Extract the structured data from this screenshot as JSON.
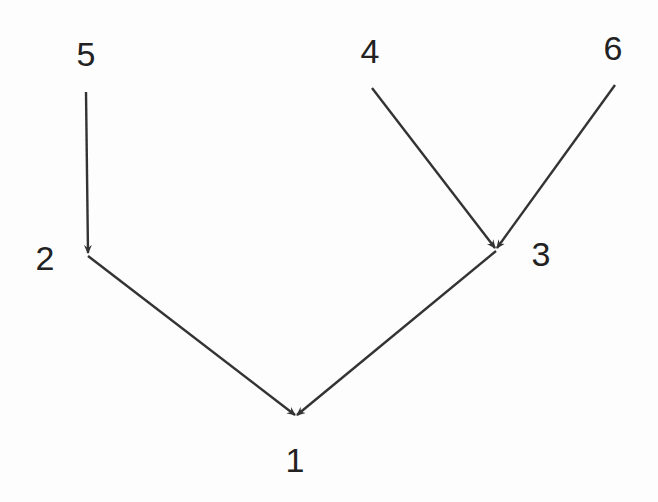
{
  "diagram": {
    "type": "directed-tree",
    "stroke_color": "#333333",
    "label_color": "#222222",
    "background": "#fdfdfd",
    "nodes": [
      {
        "id": "1",
        "label": "1",
        "x": 295,
        "y": 460
      },
      {
        "id": "2",
        "label": "2",
        "x": 45,
        "y": 258
      },
      {
        "id": "3",
        "label": "3",
        "x": 541,
        "y": 254
      },
      {
        "id": "4",
        "label": "4",
        "x": 370,
        "y": 51
      },
      {
        "id": "5",
        "label": "5",
        "x": 86,
        "y": 54
      },
      {
        "id": "6",
        "label": "6",
        "x": 613,
        "y": 48
      }
    ],
    "edges": [
      {
        "from": "5",
        "to": "2",
        "x1": 86,
        "y1": 92,
        "x2": 88,
        "y2": 253
      },
      {
        "from": "4",
        "to": "3",
        "x1": 372,
        "y1": 88,
        "x2": 495,
        "y2": 248
      },
      {
        "from": "6",
        "to": "3",
        "x1": 615,
        "y1": 85,
        "x2": 497,
        "y2": 248
      },
      {
        "from": "2",
        "to": "1",
        "x1": 88,
        "y1": 256,
        "x2": 295,
        "y2": 415
      },
      {
        "from": "3",
        "to": "1",
        "x1": 496,
        "y1": 251,
        "x2": 297,
        "y2": 415
      }
    ]
  }
}
